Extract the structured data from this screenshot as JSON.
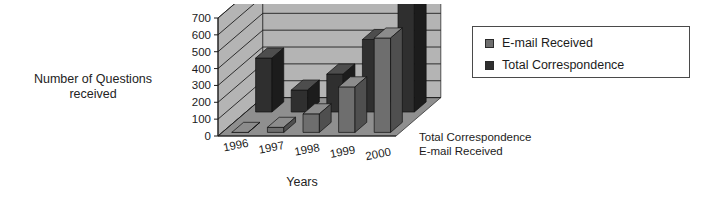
{
  "chart_data": {
    "type": "bar",
    "render": "3d-bar",
    "title": "",
    "xlabel": "Years",
    "ylabel": "Number of Questions received",
    "categories": [
      "1996",
      "1997",
      "1998",
      "1999",
      "2000"
    ],
    "series": [
      {
        "name": "E-mail Received",
        "color": "#6e6e6e",
        "values": [
          0,
          30,
          110,
          270,
          560
        ]
      },
      {
        "name": "Total Correspondence",
        "color": "#2f2f2f",
        "values": [
          320,
          130,
          225,
          430,
          660
        ]
      }
    ],
    "yticks": [
      0,
      100,
      200,
      300,
      400,
      500,
      600,
      700
    ],
    "ylim": [
      0,
      700
    ],
    "grid": true,
    "legend_position": "right",
    "series_axis_labels": [
      "Total Correspondence",
      "E-mail Received"
    ],
    "annotations": []
  },
  "legend": {
    "items": [
      {
        "label": "E-mail Received",
        "color": "#6e6e6e"
      },
      {
        "label": "Total Correspondence",
        "color": "#2f2f2f"
      }
    ]
  },
  "axes": {
    "y_title_line1": "Number of Questions",
    "y_title_line2": "received",
    "x_title": "Years"
  },
  "series_axis": {
    "line1": "Total Correspondence",
    "line2": "E-mail Received"
  },
  "colors": {
    "wall": "#b4b4b4",
    "floor": "#8f8f8f",
    "gridline": "#1e1e1e",
    "email_front": "#6e6e6e",
    "email_top": "#8c8c8c",
    "email_side": "#4f4f4f",
    "total_front": "#2f2f2f",
    "total_top": "#4d4d4d",
    "total_side": "#1c1c1c",
    "background": "#ffffff"
  }
}
